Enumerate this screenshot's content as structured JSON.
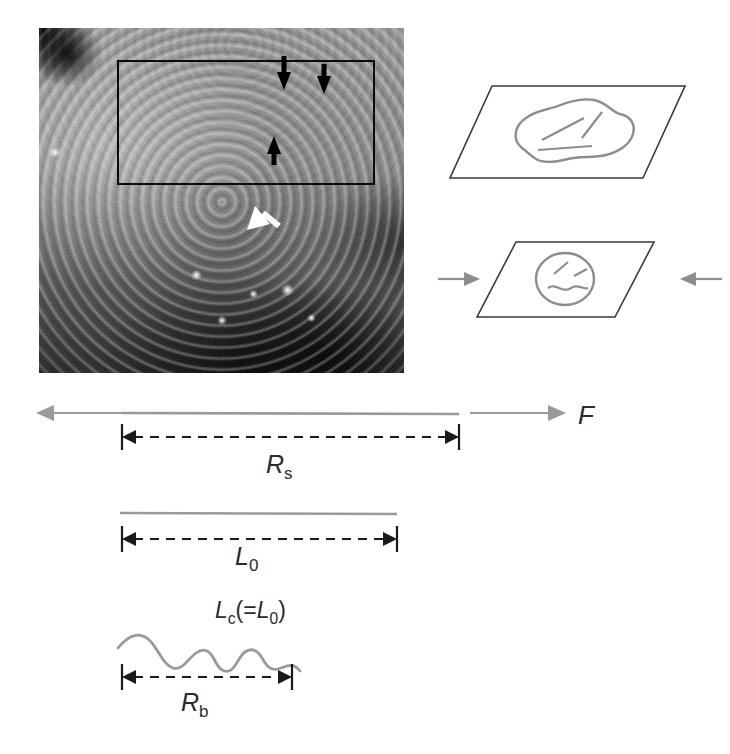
{
  "figure": {
    "background_color": "#ffffff",
    "line_gray": "#9a9a9a",
    "line_black": "#1a1a1a"
  },
  "micrograph": {
    "name": "sem-micrograph",
    "description": "Scanning electron micrograph of banded collagen fibres",
    "inset_label": "inset-region",
    "annotations": [
      {
        "id": "black-arrow-down-1",
        "color": "#000000",
        "direction": "down"
      },
      {
        "id": "black-arrow-down-2",
        "color": "#000000",
        "direction": "down"
      },
      {
        "id": "black-arrow-up-1",
        "color": "#000000",
        "direction": "up"
      },
      {
        "id": "white-arrow-down-1",
        "color": "#ffffff",
        "direction": "down"
      }
    ]
  },
  "planes": {
    "upper": {
      "name": "relaxed-plane",
      "shape_label": "relaxed-fibril-cross-section",
      "internal_marks": 3
    },
    "lower": {
      "name": "compressed-plane",
      "shape_label": "compressed-fibril-cross-section",
      "internal_marks": 3,
      "left_arrow": "compression-arrow-left",
      "right_arrow": "compression-arrow-right"
    }
  },
  "diagrams": {
    "stretched": {
      "name": "stretched-fibre-row",
      "force_label": "F",
      "dimension_label_base": "R",
      "dimension_label_sub": "s",
      "dimension_label_full": "Rs"
    },
    "relaxed": {
      "name": "relaxed-fibre-row",
      "dimension_label_base": "L",
      "dimension_label_sub": "0",
      "dimension_label_full": "L0"
    },
    "crimped": {
      "name": "crimped-fibre-row",
      "contour_label_base": "L",
      "contour_label_sub": "c",
      "contour_label_suffix": "(=",
      "contour_label_base2": "L",
      "contour_label_sub2": "0",
      "contour_label_close": ")",
      "dimension_label_base": "R",
      "dimension_label_sub": "b",
      "dimension_label_full": "Rb"
    }
  }
}
